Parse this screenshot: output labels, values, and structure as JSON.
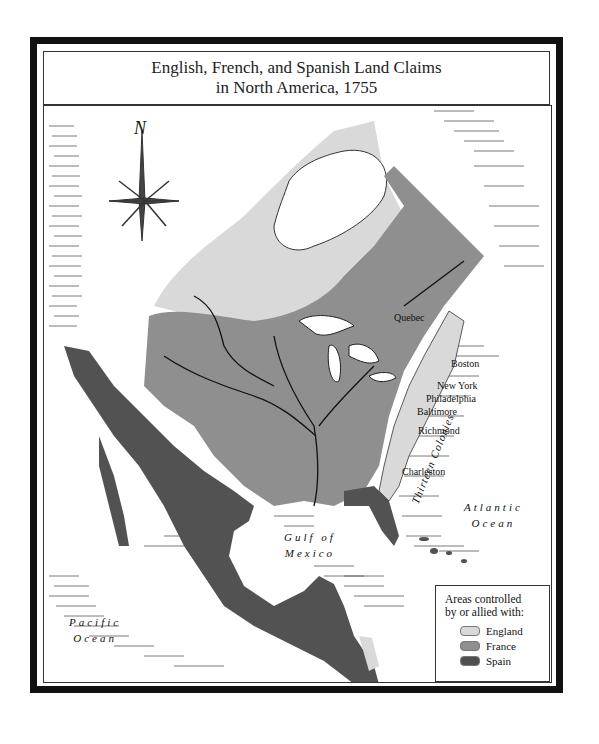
{
  "title": {
    "line1": "English, French, and Spanish Land Claims",
    "line2": "in North America, 1755"
  },
  "compass": {
    "label": "N"
  },
  "cities": [
    {
      "name": "Quebec"
    },
    {
      "name": "Boston"
    },
    {
      "name": "New York"
    },
    {
      "name": "Philadelphia"
    },
    {
      "name": "Baltimore"
    },
    {
      "name": "Richmond"
    },
    {
      "name": "Charleston"
    }
  ],
  "regions": {
    "thirteen_colonies": "Thirteen Colonies"
  },
  "water": {
    "gulf_line1": "Gulf of",
    "gulf_line2": "Mexico",
    "atlantic_line1": "Atlantic",
    "atlantic_line2": "Ocean",
    "pacific_line1": "Pacific",
    "pacific_line2": "Ocean"
  },
  "legend": {
    "heading_line1": "Areas controlled",
    "heading_line2": "by or allied with:",
    "items": [
      {
        "label": "England",
        "color": "#d9d9d9"
      },
      {
        "label": "France",
        "color": "#8f8f8f"
      },
      {
        "label": "Spain",
        "color": "#4f4f4f"
      }
    ]
  },
  "colors": {
    "england": "#d9d9d9",
    "france": "#8f8f8f",
    "spain": "#525252",
    "frame": "#111111"
  }
}
